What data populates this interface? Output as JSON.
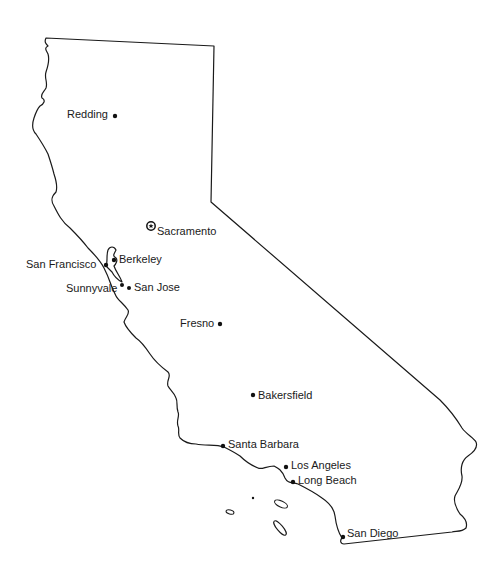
{
  "map": {
    "region": "California",
    "capital": {
      "name": "Sacramento",
      "symbol": "star-in-circle",
      "x": 151,
      "y": 226
    },
    "cities": [
      {
        "name": "Redding",
        "x": 115,
        "y": 116,
        "label_side": "left"
      },
      {
        "name": "Berkeley",
        "x": 114,
        "y": 260,
        "label_side": "right"
      },
      {
        "name": "San Francisco",
        "x": 106,
        "y": 265,
        "label_side": "left"
      },
      {
        "name": "Sunnyvale",
        "x": 122,
        "y": 285,
        "label_side": "left"
      },
      {
        "name": "San Jose",
        "x": 129,
        "y": 288,
        "label_side": "right"
      },
      {
        "name": "Fresno",
        "x": 220,
        "y": 324,
        "label_side": "left"
      },
      {
        "name": "Bakersfield",
        "x": 253,
        "y": 395,
        "label_side": "right"
      },
      {
        "name": "Santa Barbara",
        "x": 223,
        "y": 446,
        "label_side": "right"
      },
      {
        "name": "Los Angeles",
        "x": 286,
        "y": 467,
        "label_side": "right"
      },
      {
        "name": "Long Beach",
        "x": 293,
        "y": 482,
        "label_side": "right"
      },
      {
        "name": "San Diego",
        "x": 343,
        "y": 537,
        "label_side": "right"
      }
    ],
    "colors": {
      "outline": "#1a1a1a",
      "background": "#ffffff",
      "dot": "#111111"
    }
  }
}
